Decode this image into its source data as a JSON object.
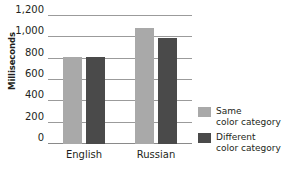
{
  "chart_data": {
    "type": "bar",
    "title": "",
    "xlabel": "",
    "ylabel": "Milliseconds",
    "categories": [
      "English",
      "Russian"
    ],
    "series": [
      {
        "name": "Same color category",
        "color": "#a9a9a9",
        "values": [
          820,
          1090
        ]
      },
      {
        "name": "Different color category",
        "color": "#4a4a4a",
        "values": [
          820,
          990
        ]
      }
    ],
    "ylim": [
      0,
      1200
    ],
    "yticks": [
      0,
      200,
      400,
      600,
      800,
      1000,
      1200
    ],
    "ytick_labels": [
      "0",
      "200",
      "400",
      "600",
      "800",
      "1,000",
      "1,200"
    ],
    "grid": true,
    "legend_position": "right"
  },
  "axis": {
    "y_title": "Milliseconds",
    "ticks": [
      {
        "value": 1200,
        "label": "1,200"
      },
      {
        "value": 1000,
        "label": "1,000"
      },
      {
        "value": 800,
        "label": "800"
      },
      {
        "value": 600,
        "label": "600"
      },
      {
        "value": 400,
        "label": "400"
      },
      {
        "value": 200,
        "label": "200"
      },
      {
        "value": 0,
        "label": "0"
      }
    ],
    "categories": [
      {
        "label": "English"
      },
      {
        "label": "Russian"
      }
    ]
  },
  "legend": {
    "entries": [
      {
        "line1": "Same",
        "line2": "color category",
        "color": "#a9a9a9"
      },
      {
        "line1": "Different",
        "line2": "color category",
        "color": "#4a4a4a"
      }
    ]
  },
  "colors": {
    "same_color_category": "#a9a9a9",
    "different_color_category": "#4a4a4a",
    "gridline": "#9b9b9b",
    "text": "#231f20",
    "background": "#ffffff"
  }
}
